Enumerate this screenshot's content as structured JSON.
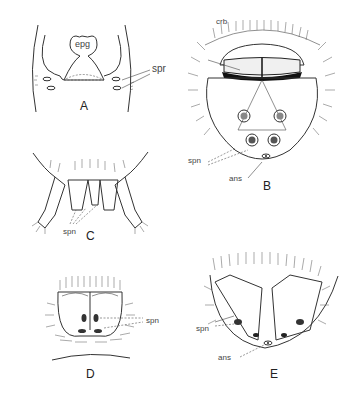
{
  "figure": {
    "panels": [
      {
        "id": "A",
        "label": "A",
        "annotations": [
          "epg",
          "spr"
        ]
      },
      {
        "id": "B",
        "label": "B",
        "annotations": [
          "crb",
          "spn",
          "ans"
        ]
      },
      {
        "id": "C",
        "label": "C",
        "annotations": [
          "spn"
        ]
      },
      {
        "id": "D",
        "label": "D",
        "annotations": [
          "spn"
        ]
      },
      {
        "id": "E",
        "label": "E",
        "annotations": [
          "spn",
          "ans"
        ]
      }
    ],
    "labels": {
      "a_epg": "epg",
      "a_spr": "spr",
      "a_panel": "A",
      "b_crb": "crb",
      "b_spn": "spn",
      "b_ans": "ans",
      "b_panel": "B",
      "c_spn": "spn",
      "c_panel": "C",
      "d_spn": "spn",
      "d_panel": "D",
      "e_spn": "spn",
      "e_ans": "ans",
      "e_panel": "E"
    },
    "colors": {
      "ink": "#333333",
      "background": "#ffffff"
    }
  }
}
